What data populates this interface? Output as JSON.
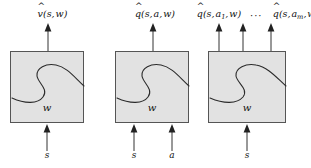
{
  "figure": {
    "background_color": "#ffffff",
    "box_fill_color": "#e2e2e2",
    "box_border_color": "#555555",
    "ink_color": "#111111"
  },
  "panels": [
    {
      "id": "state-value-network",
      "weight_label": "w",
      "outputs": [
        {
          "id": "v-hat",
          "hat": "^",
          "symbol": "v",
          "args": "(s, w)",
          "text": "v̂(s, w)"
        }
      ],
      "inputs": [
        {
          "id": "state-input",
          "label": "s"
        }
      ],
      "ellipsis": ""
    },
    {
      "id": "state-action-value-network",
      "weight_label": "w",
      "outputs": [
        {
          "id": "q-hat",
          "hat": "^",
          "symbol": "q",
          "args": "(s, a, w)",
          "text": "q̂(s, a, w)"
        }
      ],
      "inputs": [
        {
          "id": "state-input",
          "label": "s"
        },
        {
          "id": "action-input",
          "label": "a"
        }
      ],
      "ellipsis": ""
    },
    {
      "id": "action-out-value-network",
      "weight_label": "w",
      "outputs": [
        {
          "id": "q-hat-a1",
          "hat": "^",
          "symbol": "q",
          "args": "(s, a₁, w)",
          "text": "q̂(s, a₁, w)"
        },
        {
          "id": "q-hat-am",
          "hat": "^",
          "symbol": "q",
          "args": "(s, aₘ, w)",
          "text": "q̂(s, aₘ, w)"
        }
      ],
      "inputs": [
        {
          "id": "state-input",
          "label": "s"
        }
      ],
      "ellipsis": "···"
    }
  ],
  "labels": {
    "v_symbol": "v",
    "q_symbol": "q",
    "hat": "ˆ",
    "open_paren": "(",
    "close_paren": ")",
    "comma": ",",
    "state": "s",
    "action": "a",
    "weights": "w",
    "sub_1": "1",
    "sub_m": "m",
    "dots": "···"
  }
}
